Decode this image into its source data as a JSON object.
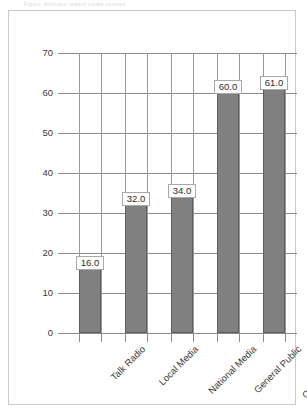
{
  "title_strip": "Figure: Attitudes toward media sources",
  "chart_data": {
    "type": "bar",
    "title": "",
    "xlabel": "",
    "ylabel": "",
    "categories": [
      "Talk Radio",
      "Local Media",
      "National Media",
      "General Public",
      "Opinion Leaders"
    ],
    "values": [
      16.0,
      32.0,
      34.0,
      60.0,
      61.0
    ],
    "data_labels": [
      "16.0",
      "32.0",
      "34.0",
      "60.0",
      "61.0"
    ],
    "ylim": [
      0,
      70
    ],
    "yticks": [
      0,
      10,
      20,
      30,
      40,
      50,
      60,
      70
    ],
    "ytick_labels": [
      "0",
      "10",
      "20",
      "30",
      "40",
      "50",
      "60",
      "70"
    ],
    "grid": "both",
    "legend": "none",
    "bar_color": "#808080",
    "bar_border_color": "#5e5e5e",
    "grid_color": "#8a8a8a",
    "frame_color": "#c9c9c9",
    "text_color": "#3a3a3a"
  }
}
